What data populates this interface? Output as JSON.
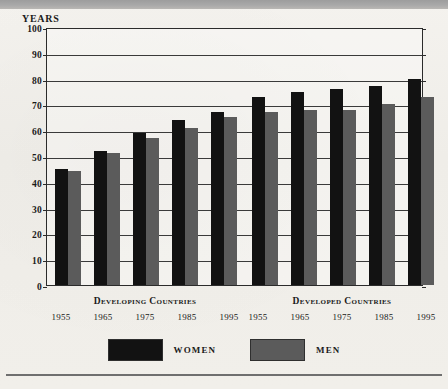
{
  "axis": {
    "caption": "YEARS",
    "ticks": [
      "100",
      "90",
      "80",
      "70",
      "60",
      "50",
      "40",
      "30",
      "20",
      "10",
      "0"
    ]
  },
  "groups": [
    {
      "name": "Developing Countries",
      "years": [
        "1955",
        "1965",
        "1975",
        "1985",
        "1995"
      ],
      "women": [
        45,
        52,
        59,
        64,
        67
      ],
      "men": [
        44,
        51,
        57,
        61,
        65
      ]
    },
    {
      "name": "Developed Countries",
      "years": [
        "1955",
        "1965",
        "1975",
        "1985",
        "1995"
      ],
      "women": [
        73,
        75,
        76,
        77,
        80
      ],
      "men": [
        67,
        68,
        68,
        70,
        73
      ]
    }
  ],
  "legend": {
    "women_label": "WOMEN",
    "men_label": "MEN",
    "women_color": "#121212",
    "men_color": "#5b5b5b"
  },
  "chart_data": {
    "type": "bar",
    "title": "",
    "subtitle": "",
    "xlabel": "",
    "ylabel": "YEARS",
    "ylim": [
      0,
      100
    ],
    "ytick_step": 10,
    "yticks": [
      0,
      10,
      20,
      30,
      40,
      50,
      60,
      70,
      80,
      90,
      100
    ],
    "grid": "horizontal",
    "legend_position": "bottom-center",
    "legend_entries": [
      "WOMEN",
      "MEN"
    ],
    "group_labels": [
      "Developing Countries",
      "Developed Countries"
    ],
    "categories": [
      "Developing 1955",
      "Developing 1965",
      "Developing 1975",
      "Developing 1985",
      "Developing 1995",
      "Developed 1955",
      "Developed 1965",
      "Developed 1975",
      "Developed 1985",
      "Developed 1995"
    ],
    "series": [
      {
        "name": "WOMEN",
        "color": "#121212",
        "values": [
          45,
          52,
          59,
          64,
          67,
          73,
          75,
          76,
          77,
          80
        ]
      },
      {
        "name": "MEN",
        "color": "#5b5b5b",
        "values": [
          44,
          51,
          57,
          61,
          65,
          67,
          68,
          68,
          70,
          73
        ]
      }
    ],
    "units": "years (life expectancy at birth)"
  }
}
